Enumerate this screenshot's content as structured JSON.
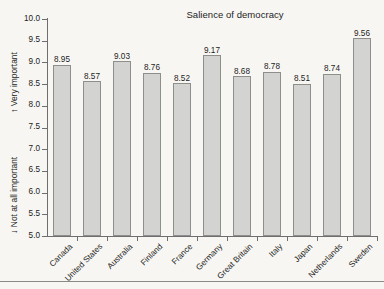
{
  "figure": {
    "background_color": "#f7f6f3",
    "axis_color": "#6e6e6e",
    "bar_fill_color": "#d3d3d1",
    "bar_border_color": "#8e8e8c",
    "bottom_rule_color": "#8a8a88"
  },
  "axis_captions": {
    "high": {
      "arrow": "↑",
      "text": "Very important"
    },
    "low": {
      "arrow": "↓",
      "text": "Not at all important"
    }
  },
  "chart_data": {
    "type": "bar",
    "title": "Salience of democracy",
    "xlabel": "",
    "ylabel": "",
    "ylim": [
      5.0,
      10.0
    ],
    "ytick_step": 0.5,
    "yticks": [
      "10.0",
      "9.5",
      "9.0",
      "8.5",
      "8.0",
      "7.5",
      "7.0",
      "6.5",
      "6.0",
      "5.5",
      "5.0"
    ],
    "grid": false,
    "legend": "none",
    "value_labels": true,
    "categories": [
      "Canada",
      "United States",
      "Australia",
      "Finland",
      "France",
      "Germany",
      "Great Britain",
      "Italy",
      "Japan",
      "Netherlands",
      "Sweden"
    ],
    "values": [
      8.95,
      8.57,
      9.03,
      8.76,
      8.52,
      9.17,
      8.68,
      8.78,
      8.51,
      8.74,
      9.56
    ],
    "value_text": [
      "8.95",
      "8.57",
      "9.03",
      "8.76",
      "8.52",
      "9.17",
      "8.68",
      "8.78",
      "8.51",
      "8.74",
      "9.56"
    ]
  }
}
